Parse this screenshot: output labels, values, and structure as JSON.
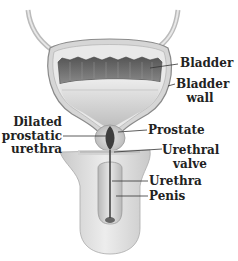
{
  "diagram": {
    "type": "anatomical illustration",
    "labels": {
      "bladder": "Bladder",
      "bladder_wall_1": "Bladder",
      "bladder_wall_2": "wall",
      "dilated_1": "Dilated",
      "dilated_2": "prostatic",
      "dilated_3": "urethra",
      "prostate": "Prostate",
      "valve_1": "Urethral",
      "valve_2": "valve",
      "urethra": "Urethra",
      "penis": "Penis"
    },
    "colors": {
      "background": "#ffffff",
      "label_text": "#222222",
      "leader_line": "#333333",
      "tissue_light": "#e6e6e6",
      "tissue_mid": "#c4c4c4",
      "bladder_muscle": "#6f6f6f",
      "urine": "#d9d9d9",
      "dilated_urethra": "#3d3d3d"
    }
  }
}
